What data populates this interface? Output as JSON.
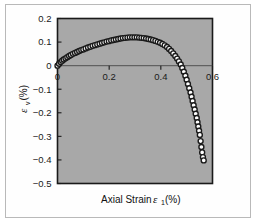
{
  "figure": {
    "background_color": "#ffffff",
    "frame_color": "#b9b9b9",
    "plot_background_color": "#a8a8a8",
    "plot_border_color": "#1a1a1a",
    "marker_edge_color": "#1a1a1a",
    "marker_face_color": "#ffffff"
  },
  "chart_data": {
    "type": "scatter",
    "title": "",
    "xlabel": "Axial Strain",
    "xlabel_symbol": "ε",
    "xlabel_subscript": "1",
    "xlabel_units": "(%)",
    "ylabel": "",
    "ylabel_symbol": "ε",
    "ylabel_subscript": "v",
    "ylabel_units": "(%)",
    "xlim": [
      0,
      0.6
    ],
    "ylim": [
      -0.5,
      0.2
    ],
    "xticks": [
      0,
      0.2,
      0.4,
      0.6
    ],
    "xtick_labels": [
      "0",
      "0.2",
      "0.4",
      "0.6"
    ],
    "yticks": [
      -0.5,
      -0.4,
      -0.3,
      -0.2,
      -0.1,
      0,
      0.1,
      0.2
    ],
    "ytick_labels": [
      "-0.5",
      "-0.4",
      "-0.3",
      "-0.2",
      "-0.1",
      "0",
      "0.1",
      "0.2"
    ],
    "grid": false,
    "zero_line": true,
    "legend": null,
    "marker": "open-circle",
    "series": [
      {
        "name": "volumetric strain vs axial strain",
        "x": [
          0.0,
          0.006,
          0.012,
          0.018,
          0.024,
          0.031,
          0.038,
          0.045,
          0.052,
          0.06,
          0.068,
          0.076,
          0.084,
          0.092,
          0.1,
          0.109,
          0.118,
          0.127,
          0.136,
          0.145,
          0.154,
          0.163,
          0.172,
          0.181,
          0.19,
          0.199,
          0.208,
          0.217,
          0.226,
          0.235,
          0.244,
          0.253,
          0.262,
          0.271,
          0.28,
          0.289,
          0.298,
          0.307,
          0.316,
          0.325,
          0.334,
          0.343,
          0.352,
          0.361,
          0.37,
          0.379,
          0.388,
          0.397,
          0.406,
          0.415,
          0.424,
          0.432,
          0.44,
          0.448,
          0.456,
          0.463,
          0.47,
          0.477,
          0.483,
          0.489,
          0.495,
          0.5,
          0.505,
          0.51,
          0.515,
          0.519,
          0.523,
          0.527,
          0.531,
          0.535,
          0.539,
          0.542,
          0.545,
          0.548,
          0.551,
          0.554,
          0.557,
          0.56,
          0.563,
          0.566
        ],
        "y": [
          0.0,
          0.008,
          0.015,
          0.021,
          0.026,
          0.031,
          0.036,
          0.041,
          0.045,
          0.05,
          0.054,
          0.058,
          0.062,
          0.066,
          0.069,
          0.073,
          0.077,
          0.08,
          0.084,
          0.087,
          0.09,
          0.093,
          0.096,
          0.099,
          0.102,
          0.104,
          0.107,
          0.109,
          0.111,
          0.113,
          0.115,
          0.117,
          0.118,
          0.119,
          0.12,
          0.12,
          0.12,
          0.12,
          0.119,
          0.118,
          0.117,
          0.115,
          0.113,
          0.111,
          0.108,
          0.105,
          0.101,
          0.097,
          0.092,
          0.086,
          0.079,
          0.071,
          0.062,
          0.052,
          0.041,
          0.03,
          0.018,
          0.005,
          -0.01,
          -0.026,
          -0.043,
          -0.06,
          -0.078,
          -0.096,
          -0.114,
          -0.132,
          -0.15,
          -0.168,
          -0.186,
          -0.204,
          -0.222,
          -0.24,
          -0.258,
          -0.276,
          -0.294,
          -0.32,
          -0.345,
          -0.368,
          -0.388,
          -0.402
        ]
      }
    ]
  }
}
